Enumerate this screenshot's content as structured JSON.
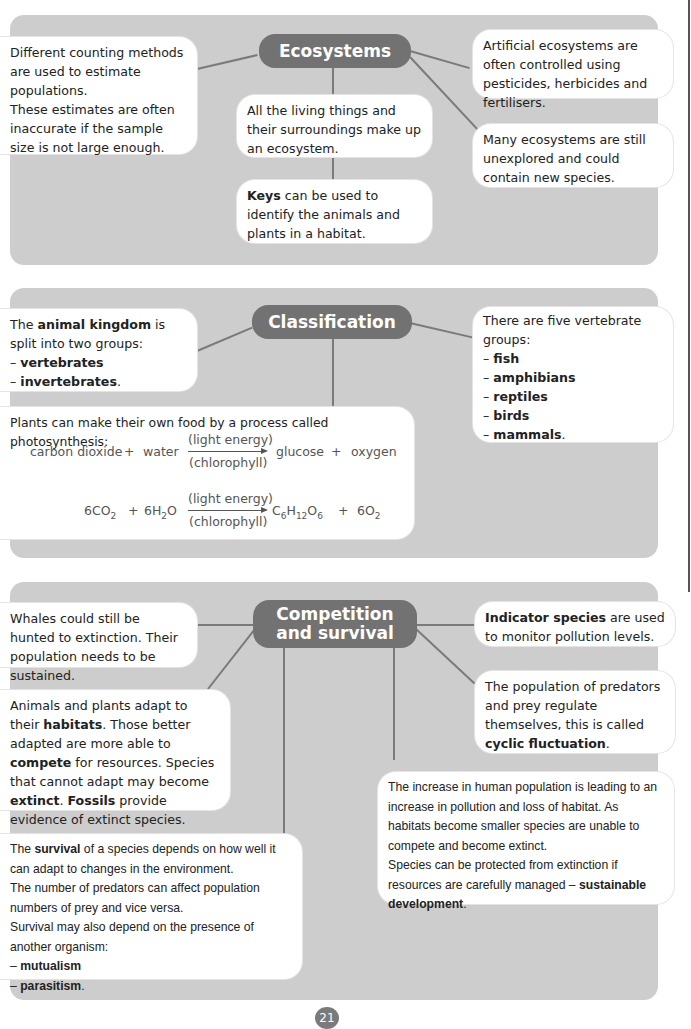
{
  "sections": {
    "ecosystems": {
      "title": "Ecosystems",
      "boxes": {
        "counting": [
          "Different counting methods are used to estimate populations.",
          "These estimates are often inaccurate if the sample size is not large enough."
        ],
        "living_things": "All the living things and their surroundings make up an ecosystem.",
        "keys_bold": "Keys",
        "keys_rest": " can be used to identify the animals and plants in a habitat.",
        "artificial": "Artificial ecosystems are often controlled using pesticides, herbicides and fertilisers.",
        "unexplored": "Many ecosystems are still unexplored and could contain new species."
      }
    },
    "classification": {
      "title": "Classification",
      "animal_kingdom": {
        "pre": "The ",
        "bold": "animal kingdom",
        "post": " is split into two groups:",
        "items": [
          "vertebrates",
          "invertebrates"
        ]
      },
      "vertebrate_groups": {
        "intro": "There are five vertebrate groups:",
        "items": [
          "fish",
          "amphibians",
          "reptiles",
          "birds",
          "mammals"
        ]
      },
      "photosynthesis": {
        "intro": "Plants can make their own food by a process called photosynthesis:",
        "word_equation": {
          "reactant1": "carbon dioxide",
          "plus": "+",
          "reactant2": "water",
          "above": "(light energy)",
          "below": "(chlorophyll)",
          "product1": "glucose",
          "product2": "oxygen"
        },
        "symbol_equation": {
          "r1": "6CO",
          "r1_sub": "2",
          "r2": "6H",
          "r2_sub": "2",
          "r2_tail": "O",
          "above": "(light energy)",
          "below": "(chlorophyll)",
          "p1_c": "C",
          "p1_c_sub": "6",
          "p1_h": "H",
          "p1_h_sub": "12",
          "p1_o": "O",
          "p1_o_sub": "6",
          "p2": "6O",
          "p2_sub": "2"
        }
      }
    },
    "competition": {
      "title_line1": "Competition",
      "title_line2": "and survival",
      "whales": "Whales could still be hunted to extinction. Their population needs to be sustained.",
      "adapt": {
        "t1": "Animals and plants adapt to their ",
        "b1": "habitats",
        "t2": ". Those better adapted are more able to ",
        "b2": "compete",
        "t3": " for resources. Species that cannot adapt may become ",
        "b3": "extinct",
        "t4": ". ",
        "b4": "Fossils",
        "t5": " provide evidence of extinct species."
      },
      "survival": {
        "t1": "The ",
        "b1": "survival",
        "t2": " of a species depends on how well it can adapt to changes in the environment.",
        "p2": "The number of predators can affect population numbers of prey and vice versa.",
        "p3": "Survival may also depend on the presence of another organism:",
        "items": [
          "mutualism",
          "parasitism"
        ]
      },
      "indicator": {
        "bold": "Indicator species",
        "rest": " are used to monitor pollution levels."
      },
      "predators": {
        "t1": "The population of predators and prey regulate themselves, this is called ",
        "b1": "cyclic fluctuation",
        "t2": "."
      },
      "human": {
        "p1": "The increase in human population is leading to an increase in pollution and loss of habitat. As habitats become smaller species are unable to compete and become extinct.",
        "p2": "Species can be protected from extinction if resources are carefully managed – ",
        "b1": "sustainable development",
        "t2": "."
      }
    }
  },
  "page_number": "21",
  "dash": "– ",
  "period": "."
}
